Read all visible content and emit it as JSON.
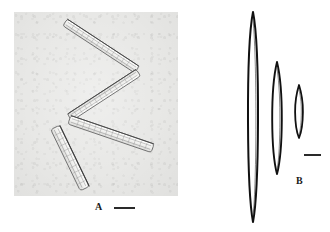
{
  "figure": {
    "type": "two-panel scientific micrograph figure of diatoms",
    "background_color": "#ffffff",
    "width": 330,
    "height": 232
  },
  "panels": [
    {
      "id": "A",
      "label": "A",
      "kind": "photomicrograph",
      "background_color": "#e8e8e6",
      "outline_color": "#555555",
      "subject": "zigzag chain of four elongated needle-shaped diatom cells",
      "scale_bar": {
        "label": "",
        "color": "#2a2a2a",
        "length_px": 21
      },
      "cells": [
        {
          "name": "cell-1",
          "x1": 52,
          "y1": 11,
          "x2": 122,
          "y2": 57,
          "width": 8
        },
        {
          "name": "cell-2",
          "x1": 124,
          "y1": 60,
          "x2": 56,
          "y2": 106,
          "width": 8
        },
        {
          "name": "cell-3",
          "x1": 56,
          "y1": 108,
          "x2": 138,
          "y2": 136,
          "width": 9
        },
        {
          "name": "cell-4",
          "x1": 42,
          "y1": 116,
          "x2": 71,
          "y2": 176,
          "width": 10
        }
      ]
    },
    {
      "id": "B",
      "label": "B",
      "kind": "line-drawing",
      "background_color": "#ffffff",
      "outline_color": "#111111",
      "subject": "three lanceolate diatom valve outlines of decreasing size",
      "scale_bar": {
        "label": "",
        "color": "#2a2a2a",
        "length_px": 17
      },
      "valves": [
        {
          "name": "valve-large",
          "cx": 58,
          "cy": 117,
          "half_length": 105,
          "half_width": 5.0
        },
        {
          "name": "valve-medium",
          "cx": 82,
          "cy": 118,
          "half_length": 56,
          "half_width": 5.0
        },
        {
          "name": "valve-small",
          "cx": 104,
          "cy": 111,
          "half_length": 26,
          "half_width": 4.0
        }
      ]
    }
  ],
  "colors": {
    "page_background": "#ffffff",
    "micrograph_background": "#e8e8e6",
    "ink": "#111111",
    "label_text": "#1a1a1a",
    "scale_bar": "#2a2a2a"
  }
}
